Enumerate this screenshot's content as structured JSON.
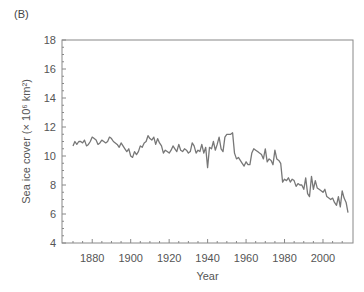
{
  "panel_label": "(B)",
  "chart_data": {
    "type": "line",
    "title": "",
    "xlabel": "Year",
    "ylabel": "Sea ice cover (× 10⁶ km²)",
    "xlim": [
      1865,
      2015
    ],
    "ylim": [
      4,
      18
    ],
    "x_ticks": [
      1880,
      1900,
      1920,
      1940,
      1960,
      1980,
      2000
    ],
    "y_ticks": [
      4,
      6,
      8,
      10,
      12,
      14,
      16,
      18
    ],
    "grid": false,
    "legend": null,
    "line_color": "#777777",
    "series": [
      {
        "name": "Sea ice cover",
        "x": [
          1870,
          1871,
          1872,
          1873,
          1874,
          1875,
          1876,
          1877,
          1878,
          1879,
          1880,
          1881,
          1882,
          1883,
          1884,
          1885,
          1886,
          1887,
          1888,
          1889,
          1890,
          1891,
          1892,
          1893,
          1894,
          1895,
          1896,
          1897,
          1898,
          1899,
          1900,
          1901,
          1902,
          1903,
          1904,
          1905,
          1906,
          1907,
          1908,
          1909,
          1910,
          1911,
          1912,
          1913,
          1914,
          1915,
          1916,
          1917,
          1918,
          1919,
          1920,
          1921,
          1922,
          1923,
          1924,
          1925,
          1926,
          1927,
          1928,
          1929,
          1930,
          1931,
          1932,
          1933,
          1934,
          1935,
          1936,
          1937,
          1938,
          1939,
          1940,
          1941,
          1942,
          1943,
          1944,
          1945,
          1946,
          1947,
          1948,
          1949,
          1950,
          1951,
          1952,
          1953,
          1954,
          1955,
          1956,
          1957,
          1958,
          1959,
          1960,
          1961,
          1962,
          1963,
          1964,
          1965,
          1966,
          1967,
          1968,
          1969,
          1970,
          1971,
          1972,
          1973,
          1974,
          1975,
          1976,
          1977,
          1978,
          1979,
          1980,
          1981,
          1982,
          1983,
          1984,
          1985,
          1986,
          1987,
          1988,
          1989,
          1990,
          1991,
          1992,
          1993,
          1994,
          1995,
          1996,
          1997,
          1998,
          1999,
          2000,
          2001,
          2002,
          2003,
          2004,
          2005,
          2006,
          2007,
          2008,
          2009,
          2010,
          2011,
          2012,
          2013
        ],
        "values": [
          10.7,
          11.0,
          10.8,
          11.0,
          11.0,
          10.9,
          11.1,
          10.7,
          10.8,
          11.0,
          11.3,
          11.2,
          11.1,
          10.8,
          10.9,
          11.1,
          11.0,
          10.9,
          11.0,
          11.3,
          11.2,
          11.0,
          10.9,
          10.8,
          10.6,
          10.9,
          10.7,
          10.5,
          10.3,
          10.5,
          10.0,
          9.9,
          10.3,
          10.1,
          10.3,
          10.7,
          10.6,
          10.9,
          11.0,
          11.4,
          11.2,
          11.1,
          11.3,
          10.8,
          11.2,
          10.9,
          10.7,
          10.2,
          10.4,
          10.3,
          10.2,
          10.4,
          10.7,
          10.5,
          10.3,
          10.8,
          10.4,
          10.3,
          10.5,
          10.4,
          10.2,
          10.3,
          10.9,
          10.7,
          10.2,
          10.4,
          10.3,
          10.8,
          10.2,
          10.6,
          9.2,
          10.6,
          10.5,
          11.0,
          10.4,
          10.8,
          11.3,
          10.5,
          10.3,
          11.3,
          11.5,
          11.5,
          11.5,
          11.6,
          10.2,
          9.8,
          9.9,
          9.7,
          9.5,
          9.3,
          9.6,
          9.4,
          9.4,
          10.2,
          10.5,
          10.4,
          10.3,
          10.2,
          10.1,
          9.8,
          10.5,
          9.6,
          9.8,
          9.7,
          9.4,
          10.4,
          9.8,
          9.7,
          9.5,
          8.2,
          8.4,
          8.3,
          8.5,
          8.2,
          8.4,
          8.3,
          7.9,
          8.1,
          8.0,
          8.0,
          7.7,
          8.5,
          7.4,
          7.2,
          8.6,
          7.7,
          8.3,
          7.8,
          7.7,
          7.6,
          7.5,
          7.7,
          7.2,
          7.1,
          7.0,
          7.1,
          6.8,
          6.6,
          7.2,
          6.5,
          7.6,
          7.1,
          6.8,
          6.1
        ]
      }
    ]
  }
}
